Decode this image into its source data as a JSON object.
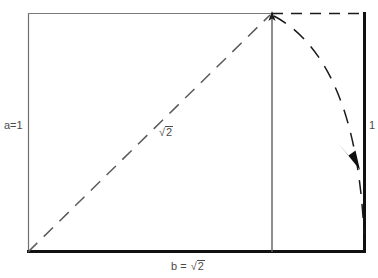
{
  "figure": {
    "type": "geometric-construction",
    "background_color": "#ffffff",
    "ink_color": "#1a1a1a",
    "light_ink_color": "#6e6e6e",
    "labels": {
      "left_side": "a=1",
      "right_side": "1",
      "bottom_side_prefix": "b = ",
      "bottom_side_radicand": "2",
      "diagonal_radicand": "2",
      "radical_sign": "√"
    },
    "geometry": {
      "rect": {
        "left": 28,
        "top": 13,
        "right": 365,
        "bottom": 252
      },
      "apex": {
        "x": 272,
        "y": 13
      },
      "origin": {
        "x": 28,
        "y": 252
      },
      "arc_end": {
        "x": 365,
        "y": 235
      },
      "arrow_head": {
        "x": 350,
        "y": 155
      },
      "dash_pattern": "11 8",
      "vertical_line_x": 272
    },
    "elements": {
      "left_edge": "solid-thin",
      "top_edge_left_segment": "solid-thin",
      "top_edge_right_segment": "dashed",
      "right_edge": "solid-thick",
      "bottom_edge": "solid-thick",
      "diagonal": "dashed",
      "arc": "dashed",
      "altitude": "solid-thin"
    }
  }
}
